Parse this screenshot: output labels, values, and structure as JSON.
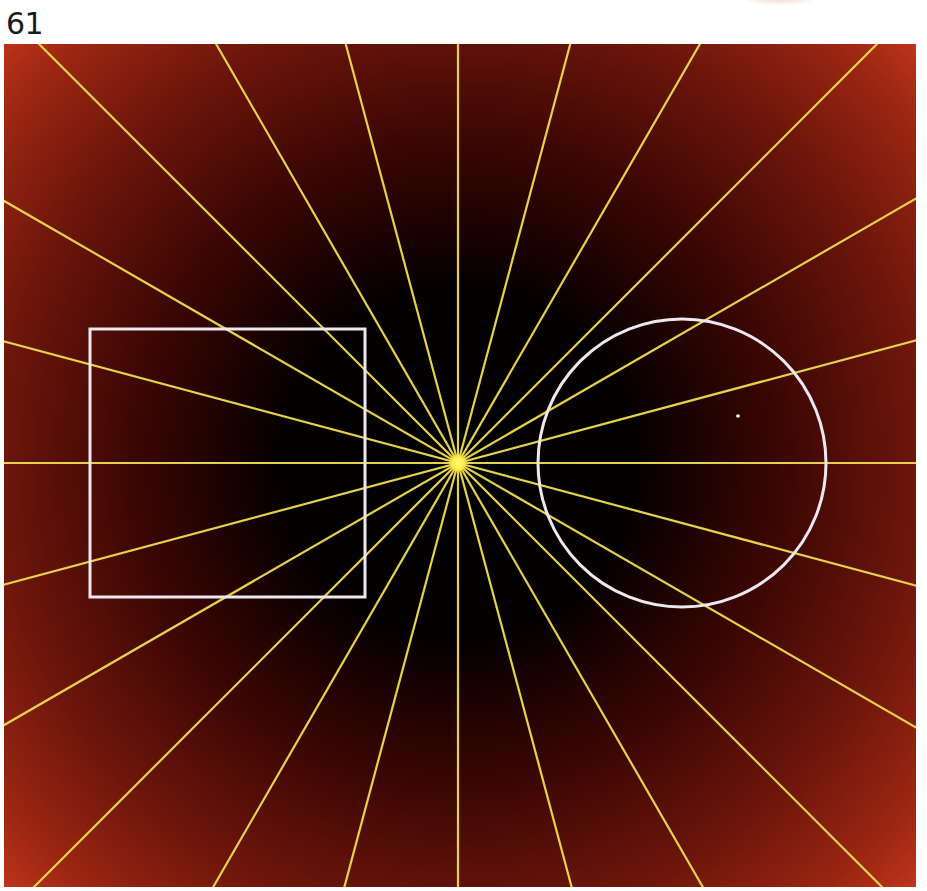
{
  "page": {
    "number": "61"
  },
  "figure": {
    "width": 912,
    "height": 843,
    "background": {
      "type": "radial-gradient",
      "center_color": "#000000",
      "mid_color": "#3a0603",
      "edge_color": "#7a1a0e",
      "corner_color": "#c8381c"
    },
    "starburst": {
      "center_x": 454,
      "center_y": 419,
      "ray_count": 24,
      "angle_step_deg": 15,
      "color": "#e6d24a",
      "stroke_width": 2.2,
      "hub_color": "#fff24a",
      "hub_radius": 6
    },
    "square": {
      "x": 86,
      "y": 285,
      "width": 275,
      "height": 268,
      "stroke": "#ece8f0",
      "stroke_width": 3
    },
    "circle": {
      "cx": 678,
      "cy": 419,
      "r": 144,
      "stroke": "#ece8f0",
      "stroke_width": 3
    },
    "speck": {
      "x": 734,
      "y": 372,
      "color": "#ffffff"
    }
  }
}
